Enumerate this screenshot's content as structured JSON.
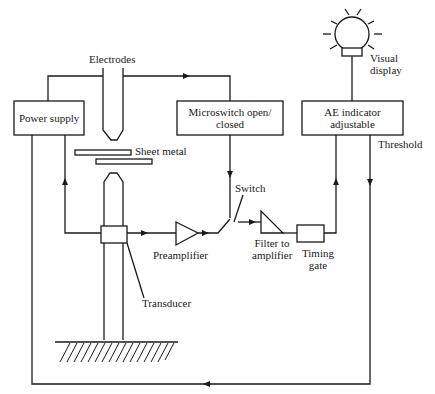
{
  "diagram": {
    "type": "block-diagram",
    "labels": {
      "electrodes": "Electrodes",
      "power_supply": "Power supply",
      "sheet_metal": "Sheet metal",
      "microswitch_line1": "Microswitch open/",
      "microswitch_line2": "closed",
      "switch": "Switch",
      "preamplifier": "Preamplifier",
      "transducer": "Transducer",
      "filter_line1": "Filter to",
      "filter_line2": "amplifier",
      "timing_line1": "Timing",
      "timing_line2": "gate",
      "ae_line1": "AE indicator",
      "ae_line2": "adjustable",
      "threshold": "Threshold",
      "visual_line1": "Visual",
      "visual_line2": "display"
    },
    "nodes": [
      {
        "id": "power_supply",
        "label": "Power supply",
        "shape": "box"
      },
      {
        "id": "electrodes",
        "label": "Electrodes",
        "shape": "electrode-pair"
      },
      {
        "id": "sheet_metal",
        "label": "Sheet metal",
        "shape": "plates"
      },
      {
        "id": "transducer",
        "label": "Transducer",
        "shape": "box"
      },
      {
        "id": "preamplifier",
        "label": "Preamplifier",
        "shape": "triangle"
      },
      {
        "id": "microswitch",
        "label": "Microswitch open/ closed",
        "shape": "box"
      },
      {
        "id": "switch",
        "label": "Switch",
        "shape": "switch"
      },
      {
        "id": "filter",
        "label": "Filter to amplifier",
        "shape": "triangle"
      },
      {
        "id": "timing_gate",
        "label": "Timing gate",
        "shape": "box"
      },
      {
        "id": "ae_indicator",
        "label": "AE indicator adjustable",
        "shape": "box"
      },
      {
        "id": "visual_display",
        "label": "Visual display",
        "shape": "lamp"
      }
    ],
    "edges": [
      {
        "from": "electrodes",
        "to": "microswitch"
      },
      {
        "from": "power_supply",
        "to": "electrodes"
      },
      {
        "from": "transducer",
        "to": "power_supply"
      },
      {
        "from": "transducer",
        "to": "preamplifier"
      },
      {
        "from": "preamplifier",
        "to": "switch"
      },
      {
        "from": "microswitch",
        "to": "switch"
      },
      {
        "from": "switch",
        "to": "filter"
      },
      {
        "from": "filter",
        "to": "timing_gate"
      },
      {
        "from": "timing_gate",
        "to": "ae_indicator"
      },
      {
        "from": "ae_indicator",
        "to": "visual_display"
      },
      {
        "from": "ae_indicator",
        "to": "power_supply",
        "label": "Threshold"
      }
    ]
  }
}
